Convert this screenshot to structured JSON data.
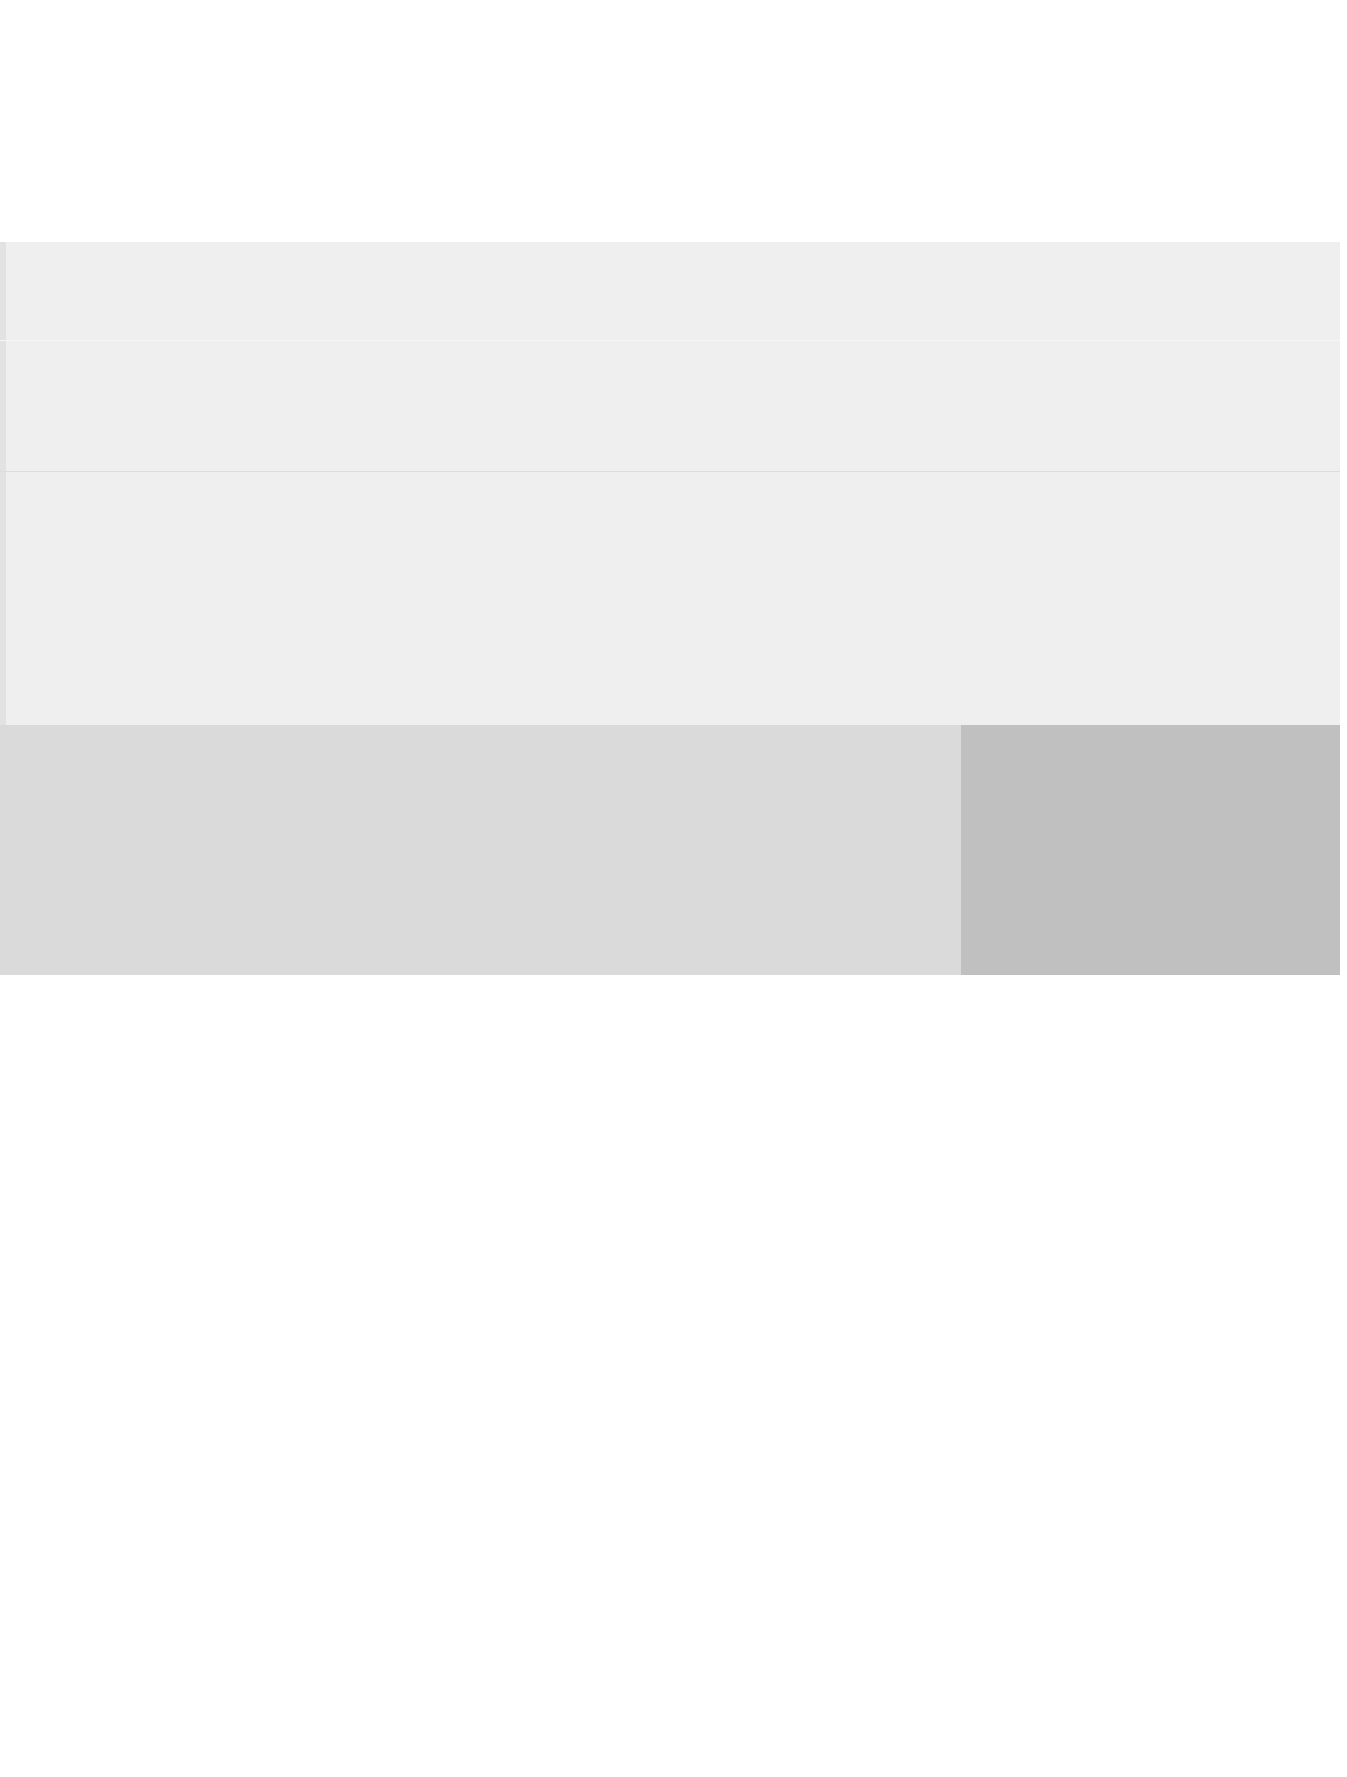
{
  "page": {
    "type": "scanned-document",
    "text_content": "",
    "regions": [
      {
        "name": "top-band",
        "color": "#efefef"
      },
      {
        "name": "bottom-left-cell",
        "color": "#dadada"
      },
      {
        "name": "bottom-right-cell",
        "color": "#c0c0c0"
      }
    ],
    "background": "#ffffff"
  }
}
